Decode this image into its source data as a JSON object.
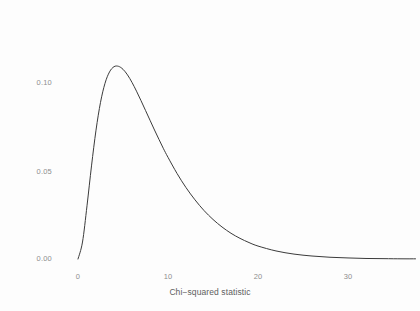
{
  "chart_data": {
    "type": "line",
    "title": "",
    "subtitle": "",
    "xlabel": "Chi−squared statistic",
    "ylabel": "Probability density",
    "xlim": [
      -1.5,
      37.5
    ],
    "ylim": [
      -0.004,
      0.1425
    ],
    "xticks": [
      0,
      10,
      20,
      30
    ],
    "xticklabels": [
      "0",
      "10",
      "20",
      "30"
    ],
    "yticks": [
      0.0,
      0.05,
      0.1
    ],
    "yticklabels": [
      "0.00",
      "0.05",
      "0.10"
    ],
    "grid": false,
    "legend": null,
    "series": [
      {
        "name": "chi-squared density (df = 6)",
        "color": "#3b3b3b",
        "linewidth": 1.0,
        "x": [
          0.0,
          0.5,
          1.0,
          1.5,
          2.0,
          2.5,
          3.0,
          3.5,
          4.0,
          4.5,
          5.0,
          5.5,
          6.0,
          6.5,
          7.0,
          7.5,
          8.0,
          8.5,
          9.0,
          9.5,
          10.0,
          11.0,
          12.0,
          13.0,
          14.0,
          15.0,
          16.0,
          17.0,
          18.0,
          19.0,
          20.0,
          22.0,
          24.0,
          26.0,
          28.0,
          30.0,
          32.0,
          34.0,
          36.0,
          37.5
        ],
        "y": [
          0.0,
          0.0097,
          0.0304,
          0.0532,
          0.0736,
          0.0895,
          0.1004,
          0.1069,
          0.1099,
          0.1101,
          0.1084,
          0.1052,
          0.1009,
          0.0959,
          0.0905,
          0.0849,
          0.0793,
          0.0737,
          0.0683,
          0.063,
          0.0581,
          0.0489,
          0.0408,
          0.0338,
          0.0277,
          0.0226,
          0.0183,
          0.0147,
          0.0118,
          0.0094,
          0.0074,
          0.0046,
          0.0028,
          0.0017,
          0.001,
          0.0006,
          0.0003,
          0.0002,
          0.0001,
          0.0001
        ],
        "peak_x": 4.1,
        "peak_y": 0.1362
      }
    ],
    "axis_style": {
      "show_axis_lines": false,
      "show_ticks": false,
      "tick_label_color": "#8e8e8e",
      "axis_title_color": "#606060",
      "background": "#fdfdfd"
    }
  }
}
